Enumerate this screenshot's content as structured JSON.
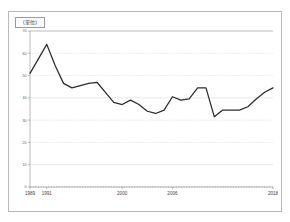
{
  "legend": {
    "label": "(単位)"
  },
  "chart_data": {
    "type": "line",
    "title": "",
    "xlabel": "",
    "ylabel": "",
    "ylim": [
      0,
      70
    ],
    "xlim": [
      1989,
      2018
    ],
    "grid": true,
    "legend_position": "top-left",
    "y_ticks": [
      0,
      10,
      20,
      30,
      40,
      50,
      60,
      70
    ],
    "y_tick_labels": [
      "0",
      "10",
      "20",
      "30",
      "40",
      "50",
      "60",
      "70"
    ],
    "x_tick_labels": [
      "1989",
      "1991",
      "2000",
      "2006",
      "2018"
    ],
    "x_tick_values": [
      1989,
      1991,
      2000,
      2006,
      2018
    ],
    "series": [
      {
        "name": "series-1",
        "color": "#2b2b2b",
        "x": [
          1989,
          1990,
          1991,
          1992,
          1993,
          1994,
          1995,
          1996,
          1997,
          1998,
          1999,
          2000,
          2001,
          2002,
          2003,
          2004,
          2005,
          2006,
          2007,
          2008,
          2009,
          2010,
          2011,
          2012,
          2013,
          2014,
          2015,
          2016,
          2017,
          2018
        ],
        "values": [
          51.0,
          57.5,
          64.0,
          54.5,
          46.5,
          44.5,
          45.5,
          46.5,
          47.0,
          42.5,
          38.0,
          37.0,
          39.0,
          37.0,
          34.0,
          33.0,
          34.5,
          40.5,
          39.0,
          39.5,
          44.5,
          44.5,
          31.5,
          34.5,
          34.5,
          34.5,
          36.0,
          39.5,
          42.5,
          44.5
        ]
      }
    ],
    "line_points_pixel_note": "values read off the 0-70 axis with 10-unit gridlines"
  }
}
